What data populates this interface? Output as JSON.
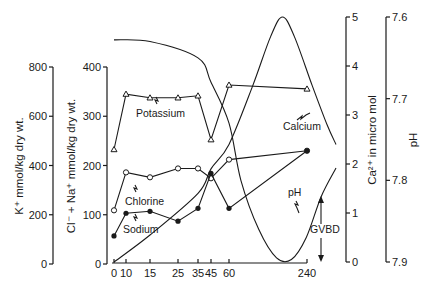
{
  "chart_data": {
    "type": "line",
    "title": "",
    "xlabel": "",
    "x": [
      0,
      10,
      15,
      25,
      35,
      45,
      60,
      240
    ],
    "x_tick_labels": [
      "0",
      "10",
      "15",
      "25",
      "35",
      "45",
      "60",
      "240"
    ],
    "axes": {
      "k": {
        "label": "K⁺ mmol/kg dry wt.",
        "range": [
          0,
          800
        ],
        "ticks": [
          "0",
          "200",
          "400",
          "600",
          "800"
        ]
      },
      "clna": {
        "label": "Cl⁻ + Na⁺ mmol/kg dry wt.",
        "range": [
          0,
          400
        ],
        "ticks": [
          "0",
          "100",
          "200",
          "300",
          "400"
        ]
      },
      "ca": {
        "label": "Ca²⁺ in micro mol",
        "range": [
          0,
          5
        ],
        "ticks": [
          "0",
          "1",
          "2",
          "3",
          "4",
          "5"
        ]
      },
      "ph": {
        "label": "pH",
        "range": [
          7.9,
          7.6
        ],
        "ticks": [
          "7.9",
          "7.8",
          "7.7",
          "7.6"
        ]
      }
    },
    "series": [
      {
        "name": "Potassium",
        "axis": "k",
        "marker": "triangle-open",
        "values": [
          465,
          690,
          675,
          675,
          683,
          505,
          727,
          711
        ]
      },
      {
        "name": "Chlorine",
        "axis": "clna",
        "marker": "circle-open",
        "values": [
          109,
          186,
          176,
          194,
          194,
          174,
          212,
          230
        ]
      },
      {
        "name": "Sodium",
        "axis": "clna",
        "marker": "circle-filled",
        "values": [
          57,
          103,
          107,
          87,
          113,
          184,
          113,
          230
        ]
      }
    ],
    "curves": [
      {
        "name": "Calcium",
        "axis": "ca",
        "description": "smooth curve rising from 0 to peak ~5 near t≈150, then falling to ~2.4 near end",
        "points": [
          [
            0,
            0
          ],
          [
            15,
            0.55
          ],
          [
            35,
            1.4
          ],
          [
            45,
            1.9
          ],
          [
            60,
            2.4
          ],
          [
            100,
            3.6
          ],
          [
            130,
            4.6
          ],
          [
            150,
            5.0
          ],
          [
            170,
            4.6
          ],
          [
            200,
            3.6
          ],
          [
            225,
            2.8
          ],
          [
            240,
            2.4
          ]
        ]
      },
      {
        "name": "pH",
        "axis": "ph",
        "description": "smooth curve starting ~7.62, descending to ~7.9 near t≈165, rising to ~7.78 at end",
        "points": [
          [
            0,
            7.628
          ],
          [
            15,
            7.63
          ],
          [
            35,
            7.65
          ],
          [
            45,
            7.68
          ],
          [
            60,
            7.73
          ],
          [
            80,
            7.8
          ],
          [
            110,
            7.86
          ],
          [
            140,
            7.895
          ],
          [
            165,
            7.897
          ],
          [
            190,
            7.87
          ],
          [
            215,
            7.82
          ],
          [
            240,
            7.785
          ]
        ]
      }
    ],
    "annotations": [
      {
        "text": "Potassium"
      },
      {
        "text": "Chlorine"
      },
      {
        "text": "Sodium"
      },
      {
        "text": "Calcium"
      },
      {
        "text": "pH"
      },
      {
        "text": "GVBD"
      }
    ],
    "legend": "none (inline labels)",
    "grid": false
  }
}
